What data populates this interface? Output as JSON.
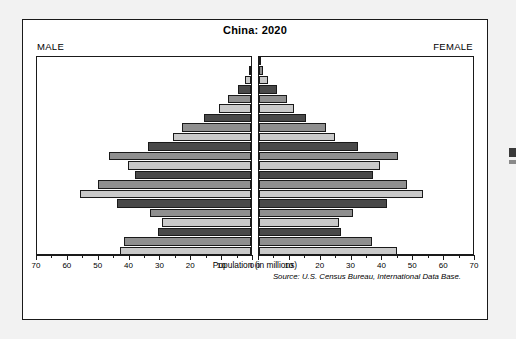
{
  "figure": {
    "title": "China: 2020",
    "male_label": "MALE",
    "female_label": "FEMALE",
    "axis_title": "Population (in millions)",
    "source": "Source: U.S. Census Bureau, International Data Base."
  },
  "colors": {
    "bar_light": "#c9c9c9",
    "bar_mid": "#8f8f8f",
    "bar_dark": "#494949",
    "frame": "#1a1a1a",
    "panel_bg": "#ffffff"
  },
  "chart_data": {
    "type": "bar",
    "subtype": "population-pyramid",
    "title": "China: 2020",
    "xlabel": "Population (in millions)",
    "ylabel": "",
    "xlim": [
      0,
      70
    ],
    "xticks": [
      0,
      10,
      20,
      30,
      40,
      50,
      60,
      70
    ],
    "xtick_labels": [
      "0",
      "10",
      "20",
      "30",
      "40",
      "50",
      "60",
      "70"
    ],
    "xtick_minor_step": 5,
    "grid": false,
    "legend": false,
    "left_axis_direction": "reversed",
    "categories": [
      "100+",
      "95-99",
      "90-94",
      "85-89",
      "80-84",
      "75-79",
      "70-74",
      "65-69",
      "60-64",
      "55-59",
      "50-54",
      "45-49",
      "40-44",
      "35-39",
      "30-34",
      "25-29",
      "20-24",
      "15-19",
      "10-14",
      "5-9",
      "0-4"
    ],
    "series": [
      {
        "name": "MALE",
        "side": "left",
        "values": [
          0.1,
          0.7,
          1.9,
          4.1,
          7.6,
          10.6,
          15.5,
          22.5,
          25.6,
          33.6,
          46.4,
          40.3,
          38.1,
          50.0,
          55.9,
          44.0,
          33.2,
          29.0,
          30.4,
          41.6,
          43.0
        ]
      },
      {
        "name": "FEMALE",
        "side": "right",
        "values": [
          0.3,
          1.4,
          3.1,
          5.8,
          9.2,
          11.6,
          15.5,
          21.8,
          24.7,
          32.5,
          45.6,
          39.7,
          37.3,
          48.3,
          53.8,
          42.0,
          30.6,
          26.3,
          26.9,
          37.1,
          45.0
        ]
      }
    ],
    "bar_shades": [
      "dark",
      "mid",
      "light",
      "dark",
      "mid",
      "light",
      "dark",
      "mid",
      "light",
      "dark",
      "mid",
      "light",
      "dark",
      "mid",
      "light",
      "dark",
      "mid",
      "light",
      "dark",
      "mid",
      "light"
    ]
  }
}
